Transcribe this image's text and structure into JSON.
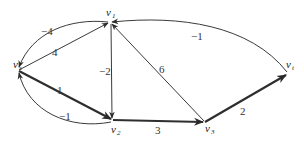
{
  "diagram": {
    "type": "directed-graph",
    "nodes": [
      {
        "id": "vs",
        "label": "v",
        "sub": "s",
        "x": 18,
        "y": 70
      },
      {
        "id": "v1",
        "label": "v",
        "sub": "1",
        "x": 110,
        "y": 22
      },
      {
        "id": "v2",
        "label": "v",
        "sub": "2",
        "x": 113,
        "y": 120
      },
      {
        "id": "v3",
        "label": "v",
        "sub": "3",
        "x": 205,
        "y": 122
      },
      {
        "id": "vt",
        "label": "v",
        "sub": "t",
        "x": 287,
        "y": 74
      }
    ],
    "edges": [
      {
        "id": "vs-v1",
        "from": "vs",
        "to": "v1",
        "weight": "4",
        "bold": false
      },
      {
        "id": "v1-vs",
        "from": "v1",
        "to": "vs",
        "weight": "−4",
        "bold": false,
        "curved": true
      },
      {
        "id": "vs-v2",
        "from": "vs",
        "to": "v2",
        "weight": "1",
        "bold": true
      },
      {
        "id": "v2-vs",
        "from": "v2",
        "to": "vs",
        "weight": "−1",
        "bold": false,
        "curved": true
      },
      {
        "id": "v1-v2",
        "from": "v1",
        "to": "v2",
        "weight": "−2",
        "bold": false
      },
      {
        "id": "v3-v1",
        "from": "v3",
        "to": "v1",
        "weight": "6",
        "bold": false
      },
      {
        "id": "v2-v3",
        "from": "v2",
        "to": "v3",
        "weight": "3",
        "bold": true
      },
      {
        "id": "v3-vt",
        "from": "v3",
        "to": "vt",
        "weight": "2",
        "bold": true
      },
      {
        "id": "vt-v1",
        "from": "vt",
        "to": "v1",
        "weight": "−1",
        "bold": false,
        "curved": true
      }
    ]
  }
}
